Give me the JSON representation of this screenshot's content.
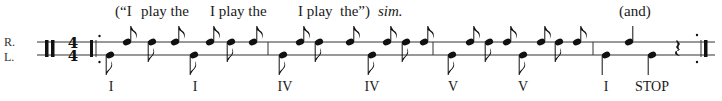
{
  "hands": {
    "right": "R.",
    "left": "L."
  },
  "time_signature": {
    "top": "4",
    "bottom": "4"
  },
  "lyrics": [
    {
      "text": "(“I",
      "x": 115
    },
    {
      "text": "play the",
      "x": 141
    },
    {
      "text": "I play the",
      "x": 210
    },
    {
      "text": "I play",
      "x": 298
    },
    {
      "text": "the”)",
      "x": 340
    },
    {
      "text": "sim.",
      "x": 378,
      "italic": true
    },
    {
      "text": "(and)",
      "x": 619
    }
  ],
  "chords": [
    {
      "label": "I",
      "x": 111
    },
    {
      "label": "I",
      "x": 195
    },
    {
      "label": "IV",
      "x": 285
    },
    {
      "label": "IV",
      "x": 372
    },
    {
      "label": "V",
      "x": 453
    },
    {
      "label": "V",
      "x": 523
    },
    {
      "label": "I",
      "x": 606
    },
    {
      "label": "STOP",
      "x": 652
    }
  ],
  "notation": {
    "staff_lines_y": [
      42,
      55
    ],
    "barlines_x": [
      268,
      433,
      593
    ],
    "notes": [
      {
        "x": 110,
        "hand": "L",
        "type": "eighth-down"
      },
      {
        "x": 127,
        "hand": "R",
        "type": "eighth-up"
      },
      {
        "x": 152,
        "hand": "R",
        "type": "eighth-down"
      },
      {
        "x": 175,
        "hand": "R",
        "type": "eighth-up"
      },
      {
        "x": 194,
        "hand": "L",
        "type": "eighth-down"
      },
      {
        "x": 210,
        "hand": "R",
        "type": "eighth-up"
      },
      {
        "x": 231,
        "hand": "R",
        "type": "eighth-down"
      },
      {
        "x": 253,
        "hand": "R",
        "type": "eighth-up"
      },
      {
        "x": 283,
        "hand": "L",
        "type": "eighth-down"
      },
      {
        "x": 300,
        "hand": "R",
        "type": "eighth-up"
      },
      {
        "x": 319,
        "hand": "R",
        "type": "eighth-down"
      },
      {
        "x": 350,
        "hand": "R",
        "type": "eighth-up"
      },
      {
        "x": 372,
        "hand": "L",
        "type": "eighth-down"
      },
      {
        "x": 387,
        "hand": "R",
        "type": "eighth-up"
      },
      {
        "x": 406,
        "hand": "R",
        "type": "eighth-down"
      },
      {
        "x": 424,
        "hand": "R",
        "type": "eighth-up"
      },
      {
        "x": 452,
        "hand": "L",
        "type": "eighth-down"
      },
      {
        "x": 470,
        "hand": "R",
        "type": "eighth-up"
      },
      {
        "x": 489,
        "hand": "R",
        "type": "eighth-down"
      },
      {
        "x": 507,
        "hand": "R",
        "type": "eighth-up"
      },
      {
        "x": 523,
        "hand": "L",
        "type": "eighth-down"
      },
      {
        "x": 541,
        "hand": "R",
        "type": "eighth-up"
      },
      {
        "x": 559,
        "hand": "R",
        "type": "eighth-down"
      },
      {
        "x": 577,
        "hand": "R",
        "type": "eighth-up"
      },
      {
        "x": 606,
        "hand": "L",
        "type": "quarter-down"
      },
      {
        "x": 629,
        "hand": "R",
        "type": "quarter-up"
      },
      {
        "x": 652,
        "hand": "L",
        "type": "quarter-down"
      }
    ],
    "rest_x": 677
  }
}
